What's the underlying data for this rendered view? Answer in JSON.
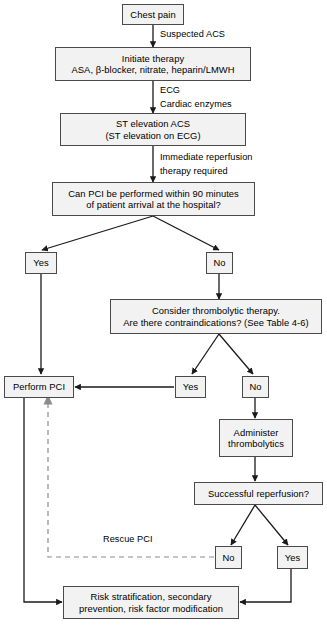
{
  "diagram": {
    "colors": {
      "box_fill": "#f2f2f2",
      "box_border": "#4a4a4a",
      "line": "#1a1a1a",
      "dashed_line": "#8c8c8c",
      "text": "#000000"
    },
    "nodes": [
      {
        "id": "chest-pain",
        "lines": [
          "Chest pain"
        ]
      },
      {
        "id": "initiate-therapy",
        "lines": [
          "Initiate therapy",
          "ASA, β-blocker, nitrate, heparin/LMWH"
        ]
      },
      {
        "id": "st-elevation",
        "lines": [
          "ST elevation ACS",
          "(ST elevation on ECG)"
        ]
      },
      {
        "id": "pci-question",
        "lines": [
          "Can PCI be performed within 90 minutes",
          "of patient arrival at the hospital?"
        ]
      },
      {
        "id": "pci-yes",
        "lines": [
          "Yes"
        ]
      },
      {
        "id": "pci-no",
        "lines": [
          "No"
        ]
      },
      {
        "id": "thrombolytic-question",
        "lines": [
          "Consider thrombolytic therapy.",
          "Are there contraindications? (See Table 4-6)"
        ]
      },
      {
        "id": "perform-pci",
        "lines": [
          "Perform PCI"
        ]
      },
      {
        "id": "contraindication-yes",
        "lines": [
          "Yes"
        ]
      },
      {
        "id": "contraindication-no",
        "lines": [
          "No"
        ]
      },
      {
        "id": "administer-thrombolytics",
        "lines": [
          "Administer",
          "thrombolytics"
        ]
      },
      {
        "id": "reperfusion-question",
        "lines": [
          "Successful reperfusion?"
        ]
      },
      {
        "id": "reperfusion-no",
        "lines": [
          "No"
        ]
      },
      {
        "id": "reperfusion-yes",
        "lines": [
          "Yes"
        ]
      },
      {
        "id": "risk-stratification",
        "lines": [
          "Risk stratification, secondary",
          "prevention, risk factor modification"
        ]
      }
    ],
    "edge_labels": [
      {
        "id": "suspected-acs",
        "text": "Suspected ACS"
      },
      {
        "id": "ecg",
        "text": "ECG"
      },
      {
        "id": "cardiac-enzymes",
        "text": "Cardiac enzymes"
      },
      {
        "id": "immediate-reperfusion",
        "text": "Immediate reperfusion"
      },
      {
        "id": "therapy-required",
        "text": "therapy required"
      },
      {
        "id": "rescue-pci",
        "text": "Rescue PCI"
      }
    ]
  }
}
